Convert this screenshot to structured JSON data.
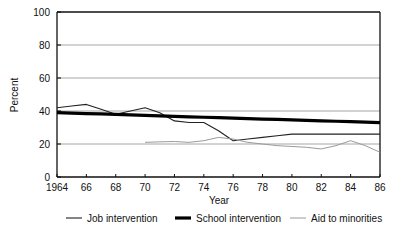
{
  "chart_data": {
    "type": "line",
    "title": "",
    "xlabel": "Year",
    "ylabel": "Percent",
    "xlim": [
      1964,
      1986
    ],
    "ylim": [
      0,
      100
    ],
    "grid": "horizontal",
    "legend_position": "bottom",
    "x": [
      1964,
      1965,
      1966,
      1967,
      1968,
      1969,
      1970,
      1971,
      1972,
      1973,
      1974,
      1975,
      1976,
      1977,
      1978,
      1979,
      1980,
      1981,
      1982,
      1983,
      1984,
      1985,
      1986
    ],
    "xtick_labels": [
      "1964",
      "66",
      "68",
      "70",
      "72",
      "74",
      "76",
      "78",
      "80",
      "82",
      "84",
      "86"
    ],
    "xtick_values": [
      1964,
      1966,
      1968,
      1970,
      1972,
      1974,
      1976,
      1978,
      1980,
      1982,
      1984,
      1986
    ],
    "ytick_labels": [
      "0",
      "20",
      "40",
      "60",
      "80",
      "100"
    ],
    "ytick_values": [
      0,
      20,
      40,
      60,
      80,
      100
    ],
    "series": [
      {
        "name": "Job intervention",
        "color": "#222222",
        "width": 1.1,
        "values": [
          42,
          43,
          44,
          41,
          38,
          40,
          42,
          39,
          34,
          33,
          33,
          28,
          22,
          23,
          24,
          25,
          26,
          26,
          26,
          26,
          26,
          26,
          26
        ]
      },
      {
        "name": "School intervention",
        "color": "#000000",
        "width": 3.2,
        "values": [
          39,
          38.7,
          38.4,
          38.2,
          37.9,
          37.6,
          37.3,
          37.1,
          36.8,
          36.5,
          36.2,
          36,
          35.7,
          35.4,
          35.1,
          34.9,
          34.6,
          34.3,
          34,
          33.8,
          33.5,
          33.2,
          33
        ]
      },
      {
        "name": "Aid to minorities",
        "color": "#9a9a9a",
        "width": 1.0,
        "start_year": 1970,
        "values": [
          null,
          null,
          null,
          null,
          null,
          null,
          21,
          21.3,
          21.5,
          21,
          22,
          24,
          23,
          21,
          20,
          19,
          18.5,
          18,
          17,
          19,
          22,
          19,
          15
        ]
      }
    ]
  },
  "legend": {
    "items": [
      {
        "label": "Job intervention",
        "swatch": "thin-dark-line-icon"
      },
      {
        "label": "School intervention",
        "swatch": "thick-black-line-icon"
      },
      {
        "label": "Aid to minorities",
        "swatch": "thin-gray-line-icon"
      }
    ]
  },
  "axes": {
    "y_title": "Percent",
    "x_title": "Year"
  }
}
